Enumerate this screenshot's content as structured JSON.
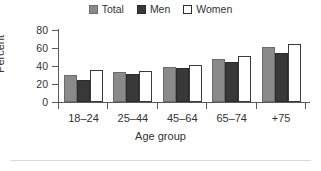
{
  "chart_data": {
    "type": "bar",
    "title": "",
    "xlabel": "Age group",
    "ylabel": "Percent",
    "ylim": [
      0,
      80
    ],
    "yticks": [
      0,
      20,
      40,
      60,
      80
    ],
    "grid": false,
    "legend_position": "top-center",
    "categories": [
      "18–24",
      "25–44",
      "45–64",
      "65–74",
      "+75"
    ],
    "series": [
      {
        "name": "Total",
        "color": "#8a8a8a",
        "values": [
          30,
          33.5,
          39,
          48,
          61
        ]
      },
      {
        "name": "Men",
        "color": "#383838",
        "values": [
          25,
          31,
          38,
          44,
          54
        ]
      },
      {
        "name": "Women",
        "color": "#ffffff",
        "values": [
          36,
          35,
          41,
          51,
          65
        ]
      }
    ]
  },
  "legend": {
    "items": [
      {
        "label": "Total",
        "swatch": "swatch-gray"
      },
      {
        "label": "Men",
        "swatch": "swatch-dark"
      },
      {
        "label": "Women",
        "swatch": "swatch-white"
      }
    ]
  },
  "axes": {
    "y": {
      "title": "Percent",
      "ticks": [
        "80",
        "60",
        "40",
        "20",
        "0"
      ]
    },
    "x": {
      "title": "Age group",
      "ticks": [
        "18–24",
        "25–44",
        "45–64",
        "65–74",
        "+75"
      ]
    }
  }
}
